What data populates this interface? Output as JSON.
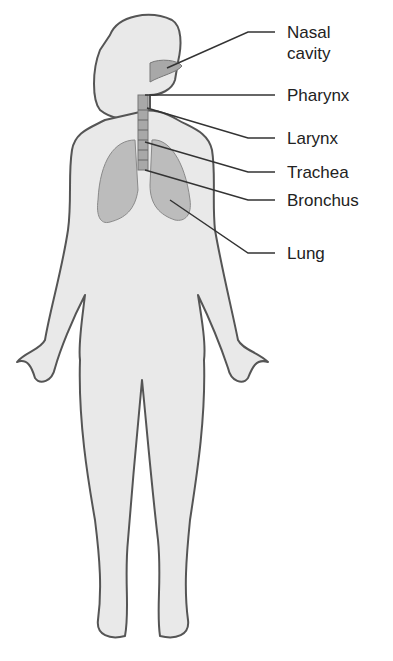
{
  "diagram": {
    "labels": [
      {
        "text": "Nasal cavity",
        "line1": "Nasal",
        "line2": "cavity"
      },
      {
        "text": "Pharynx"
      },
      {
        "text": "Larynx"
      },
      {
        "text": "Trachea"
      },
      {
        "text": "Bronchus"
      },
      {
        "text": "Lung"
      }
    ],
    "colors": {
      "skin": "#e9e9e9",
      "outline": "#555555",
      "organ": "#b9b9b9",
      "line": "#333333"
    }
  }
}
